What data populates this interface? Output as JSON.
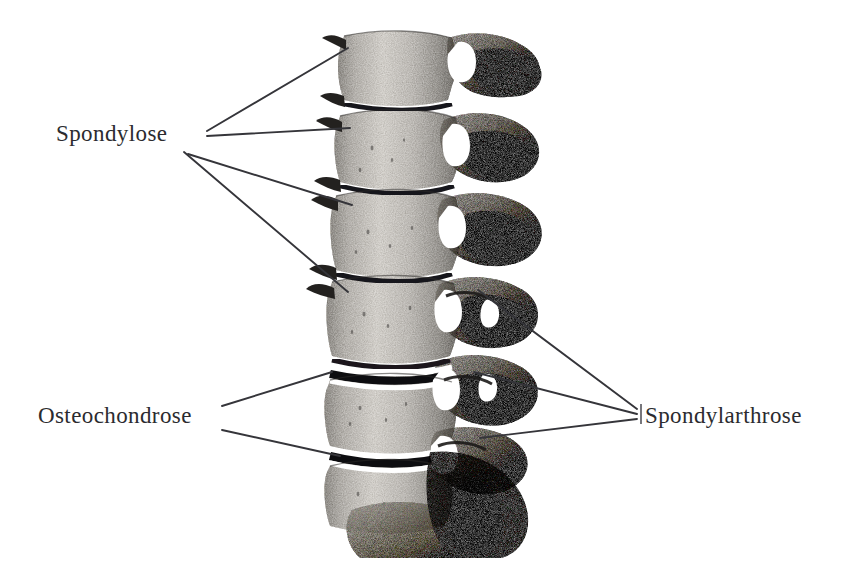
{
  "figure": {
    "view": "lateral",
    "style": "grayscale halftone anatomical engraving",
    "background_color": "#ffffff",
    "ink_color": "#2b2b2f",
    "leader_line_color": "#35353a",
    "bone_tone_light": "#c9c6c0",
    "bone_tone_mid": "#8e8b86",
    "bone_tone_dark": "#4f4d4b",
    "joint_gap_color": "#ffffff",
    "disc_space_color": "#141414",
    "image_bounds": {
      "x": 305,
      "y": 28,
      "width": 240,
      "height": 528
    }
  },
  "labels": [
    {
      "id": "spondylose",
      "text": "Spondylose",
      "x": 56,
      "y": 122,
      "leader_origin": {
        "x": 200,
        "y": 140
      },
      "leader_count": 4,
      "targets": [
        {
          "x": 348,
          "y": 48
        },
        {
          "x": 350,
          "y": 128
        },
        {
          "x": 352,
          "y": 205
        },
        {
          "x": 348,
          "y": 292
        }
      ]
    },
    {
      "id": "osteochondrose",
      "text": "Osteochondrose",
      "x": 38,
      "y": 404,
      "leader_origin": {
        "x": 222,
        "y": 410
      },
      "leader_count": 2,
      "targets": [
        {
          "x": 330,
          "y": 373
        },
        {
          "x": 338,
          "y": 455
        }
      ]
    },
    {
      "id": "spondylarthrose",
      "text": "Spondylarthrose",
      "x": 645,
      "y": 404,
      "leader_origin": {
        "x": 637,
        "y": 412
      },
      "leader_count": 3,
      "targets": [
        {
          "x": 478,
          "y": 290
        },
        {
          "x": 474,
          "y": 372
        },
        {
          "x": 480,
          "y": 438
        }
      ]
    }
  ],
  "anatomy": {
    "vertebral_bodies": 6,
    "facet_joints": 6,
    "narrowed_disc_spaces": 2,
    "osteophyte_spurs": 5,
    "sacrum_present": true
  }
}
